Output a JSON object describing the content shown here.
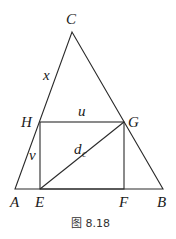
{
  "figure": {
    "caption": "图 8.18",
    "points": {
      "A": {
        "label": "A",
        "x": 15,
        "y": 189
      },
      "B": {
        "label": "B",
        "x": 163,
        "y": 189
      },
      "C": {
        "label": "C",
        "x": 72,
        "y": 32
      },
      "H": {
        "label": "H",
        "x": 40,
        "y": 122
      },
      "G": {
        "label": "G",
        "x": 124,
        "y": 122
      },
      "E": {
        "label": "E",
        "x": 40,
        "y": 189
      },
      "F": {
        "label": "F",
        "x": 124,
        "y": 189
      }
    },
    "segment_labels": {
      "x": "x",
      "u": "u",
      "v": "v",
      "d": "d",
      "d_sub": "c"
    },
    "colors": {
      "stroke": "#2a2a2a",
      "text": "#1a1a1a"
    }
  }
}
